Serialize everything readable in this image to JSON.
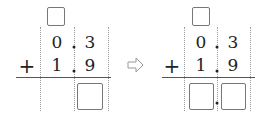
{
  "left_panel": {
    "carry_box": "",
    "row1": {
      "ones": "0",
      "tenths": "3"
    },
    "row2": {
      "operator": "+",
      "ones": "1",
      "tenths": "9"
    },
    "result_boxes": [
      "tenths"
    ]
  },
  "transition_arrow": "⇨",
  "right_panel": {
    "carry_box": "",
    "row1": {
      "ones": "0",
      "tenths": "3"
    },
    "row2": {
      "operator": "+",
      "ones": "1",
      "tenths": "9"
    },
    "result_boxes": [
      "ones",
      "tenths"
    ]
  }
}
